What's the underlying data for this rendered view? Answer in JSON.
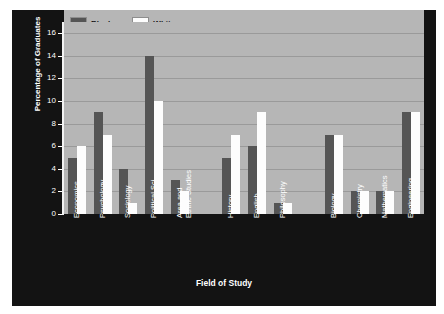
{
  "chart_data": {
    "type": "bar",
    "title": "",
    "xlabel": "Field of Study",
    "ylabel": "Percentage of Graduates",
    "ylim": [
      0,
      17
    ],
    "yticks": [
      0,
      2,
      4,
      6,
      8,
      10,
      12,
      14,
      16
    ],
    "grid": true,
    "legend_position": "top-left",
    "categories": [
      "Economics",
      "Psychology",
      "Sociology",
      "Political Sci.",
      "Area and\nEthnic Studies",
      "",
      "History",
      "English",
      "Philosophy",
      "",
      "Biology",
      "Chemistry",
      "Mathematics",
      "Engineering"
    ],
    "series": [
      {
        "name": "Black",
        "color": "#555555",
        "values": [
          5,
          9,
          4,
          14,
          3,
          null,
          5,
          6,
          1,
          null,
          7,
          2,
          2,
          9
        ]
      },
      {
        "name": "White",
        "color": "#fdfdfd",
        "values": [
          6,
          7,
          1,
          10,
          2,
          null,
          7,
          9,
          1,
          null,
          7,
          2,
          2,
          9
        ]
      }
    ]
  },
  "legend": {
    "items": [
      {
        "label": "Black",
        "color": "#555555"
      },
      {
        "label": "White",
        "color": "#fdfdfd"
      }
    ]
  },
  "axes": {
    "x_title": "Field of Study",
    "y_title": "Percentage of Graduates",
    "y_tick_labels": [
      "0",
      "2",
      "4",
      "6",
      "8",
      "10",
      "12",
      "14",
      "16"
    ],
    "x_tick_labels": [
      "Economics",
      "Psychology",
      "Sociology",
      "Political Sci.",
      "Area and\nEthnic Studies",
      "History",
      "English",
      "Philosophy",
      "Biology",
      "Chemistry",
      "Mathematics",
      "Engineering"
    ]
  },
  "colors": {
    "panel_background": "#131313",
    "plot_background": "#b6b6b6",
    "gridline": "#9a9a9a",
    "axis": "#f2f2f2",
    "text_light": "#ffffff",
    "text_dark": "#111111"
  }
}
